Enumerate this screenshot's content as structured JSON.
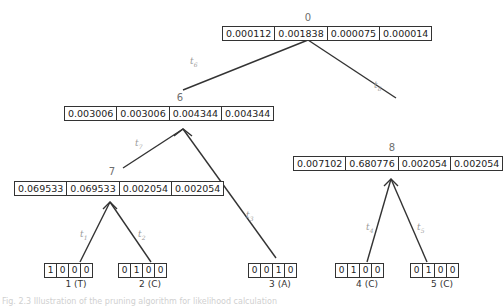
{
  "nodes": {
    "n0": {
      "label": "0",
      "values": [
        "0.000112",
        "0.001838",
        "0.000075",
        "0.000014"
      ]
    },
    "n6": {
      "label": "6",
      "values": [
        "0.003006",
        "0.003006",
        "0.004344",
        "0.004344"
      ]
    },
    "n7": {
      "label": "7",
      "values": [
        "0.069533",
        "0.069533",
        "0.002054",
        "0.002054"
      ]
    },
    "n8": {
      "label": "8",
      "values": [
        "0.007102",
        "0.680776",
        "0.002054",
        "0.002054"
      ]
    }
  },
  "tips": [
    {
      "label": "1 (T)",
      "values": [
        "1",
        "0",
        "0",
        "0"
      ]
    },
    {
      "label": "2 (C)",
      "values": [
        "0",
        "1",
        "0",
        "0"
      ]
    },
    {
      "label": "3 (A)",
      "values": [
        "0",
        "0",
        "1",
        "0"
      ]
    },
    {
      "label": "4 (C)",
      "values": [
        "0",
        "1",
        "0",
        "0"
      ]
    },
    {
      "label": "5 (C)",
      "values": [
        "0",
        "1",
        "0",
        "0"
      ]
    }
  ],
  "edges": [
    {
      "name": "t",
      "sub": "6"
    },
    {
      "name": "t",
      "sub": "8"
    },
    {
      "name": "t",
      "sub": "7"
    },
    {
      "name": "t",
      "sub": "3"
    },
    {
      "name": "t",
      "sub": "1"
    },
    {
      "name": "t",
      "sub": "2"
    },
    {
      "name": "t",
      "sub": "4"
    },
    {
      "name": "t",
      "sub": "5"
    }
  ],
  "caption": "Fig. 2.3 Illustration of the pruning algorithm for likelihood calculation"
}
